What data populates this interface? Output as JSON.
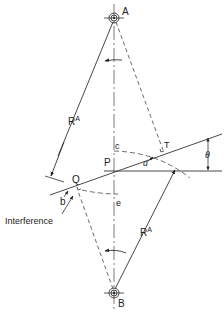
{
  "diagram": {
    "type": "gear-meshing-interference",
    "labels": {
      "pivot_top": "A",
      "pivot_bottom": "B",
      "pitch_point": "P",
      "point_c": "c",
      "point_T": "T",
      "point_a": "a",
      "point_Q": "Q",
      "point_b": "b",
      "point_e": "e",
      "angle": "θ",
      "radius_upper": "R",
      "radius_upper_sup": "A",
      "radius_lower": "R",
      "radius_lower_sup": "A",
      "callout": "Interference"
    },
    "colors": {
      "line": "#333333",
      "background": "#ffffff"
    }
  }
}
